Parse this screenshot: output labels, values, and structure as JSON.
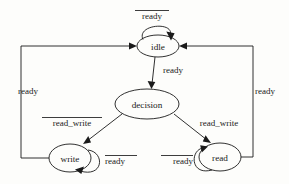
{
  "diagram": {
    "type": "finite-state-machine",
    "background_color": "#fdfdfb",
    "stroke_color": "#1a1a1a",
    "nodes": [
      {
        "id": "idle",
        "label": "idle",
        "cx": 158,
        "cy": 46,
        "rx": 21,
        "ry": 11
      },
      {
        "id": "decision",
        "label": "decision",
        "cx": 147,
        "cy": 104,
        "rx": 32,
        "ry": 15
      },
      {
        "id": "write",
        "label": "write",
        "cx": 70,
        "cy": 158,
        "rx": 21,
        "ry": 14
      },
      {
        "id": "read",
        "label": "read",
        "cx": 220,
        "cy": 157,
        "rx": 21,
        "ry": 14
      }
    ],
    "edges": [
      {
        "id": "idle-self",
        "from": "idle",
        "to": "idle",
        "label": "ready",
        "overline": true,
        "label_x": 152,
        "label_y": 19
      },
      {
        "id": "idle-decision",
        "from": "idle",
        "to": "decision",
        "label": "ready",
        "overline": false,
        "label_x": 163,
        "label_y": 73
      },
      {
        "id": "decision-write",
        "from": "decision",
        "to": "write",
        "label": "read_write",
        "overline": true,
        "label_x": 72,
        "label_y": 126
      },
      {
        "id": "decision-read",
        "from": "decision",
        "to": "read",
        "label": "read_write",
        "overline": false,
        "label_x": 219,
        "label_y": 126
      },
      {
        "id": "write-self",
        "from": "write",
        "to": "write",
        "label": "ready",
        "overline": true,
        "label_x": 113,
        "label_y": 164
      },
      {
        "id": "read-self",
        "from": "read",
        "to": "read",
        "label": "ready",
        "overline": true,
        "label_x": 178,
        "label_y": 164
      },
      {
        "id": "write-idle",
        "from": "write",
        "to": "idle",
        "label": "ready",
        "overline": false,
        "label_x": 28,
        "label_y": 94
      },
      {
        "id": "read-idle",
        "from": "read",
        "to": "idle",
        "label": "ready",
        "overline": false,
        "label_x": 262,
        "label_y": 94
      }
    ]
  }
}
